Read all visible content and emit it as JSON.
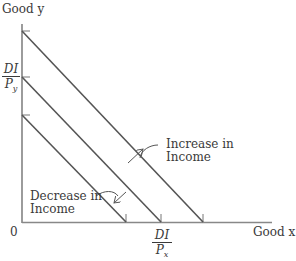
{
  "diagram": {
    "y_axis_label": "Good y",
    "x_axis_label": "Good x",
    "origin_label": "0",
    "y_intercept_label": {
      "numerator": "DI",
      "denominator": "P",
      "subscript": "y"
    },
    "x_intercept_label": {
      "numerator": "DI",
      "denominator": "P",
      "subscript": "x"
    },
    "annotations": [
      {
        "text_line1": "Increase in",
        "text_line2": "Income"
      },
      {
        "text_line1": "Decrease in",
        "text_line2": "Income"
      }
    ],
    "budget_lines": [
      {
        "name": "higher income",
        "y_intercept_px": 31,
        "x_intercept_px": 203
      },
      {
        "name": "original",
        "y_intercept_px": 77,
        "x_intercept_px": 161
      },
      {
        "name": "lower income",
        "y_intercept_px": 115,
        "x_intercept_px": 126
      }
    ],
    "colors": {
      "line": "#555555",
      "text": "#3a3a3a",
      "background": "#ffffff"
    }
  }
}
